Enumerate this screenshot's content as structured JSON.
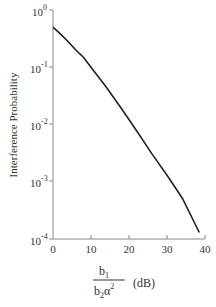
{
  "chart_data": {
    "type": "line",
    "title": "",
    "xlabel_numerator": "b",
    "xlabel_numerator_sub": "1",
    "xlabel_denominator": "b",
    "xlabel_denominator_sub": "2",
    "xlabel_denominator_greek": "α",
    "xlabel_denominator_sup": "2",
    "xlabel_unit": "(dB)",
    "ylabel": "Interference Probability",
    "yscale": "log",
    "xlim": [
      0,
      40
    ],
    "ylim": [
      0.0001,
      1
    ],
    "x_ticks": [
      "0",
      "10",
      "20",
      "30",
      "40"
    ],
    "y_ticks": [
      {
        "base": "10",
        "exp": "0"
      },
      {
        "base": "10",
        "exp": "-1"
      },
      {
        "base": "10",
        "exp": "-2"
      },
      {
        "base": "10",
        "exp": "-3"
      },
      {
        "base": "10",
        "exp": "-4"
      }
    ],
    "grid": false,
    "series": [
      {
        "name": "Interference Probability",
        "x": [
          0,
          2,
          4,
          6,
          8,
          10,
          14,
          18,
          22,
          26,
          30,
          34,
          38.5
        ],
        "y": [
          0.5,
          0.38,
          0.28,
          0.2,
          0.15,
          0.1,
          0.045,
          0.019,
          0.0078,
          0.0031,
          0.0013,
          0.00052,
          0.00013
        ]
      }
    ]
  }
}
